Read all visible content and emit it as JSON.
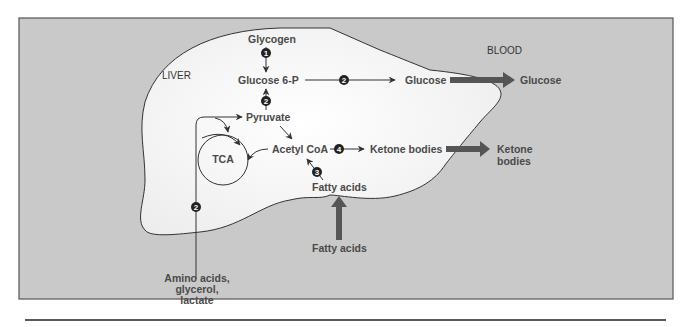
{
  "diagram": {
    "regions": {
      "liver": "LIVER",
      "blood": "BLOOD"
    },
    "nodes": {
      "glycogen": "Glycogen",
      "glucose6p": "Glucose 6-P",
      "glucose_liver": "Glucose",
      "glucose_blood": "Glucose",
      "pyruvate": "Pyruvate",
      "tca": "TCA",
      "acetyl_coa": "Acetyl CoA",
      "ketone_liver": "Ketone bodies",
      "ketone_blood_line1": "Ketone",
      "ketone_blood_line2": "bodies",
      "fatty_acids_liver": "Fatty acids",
      "fatty_acids_blood": "Fatty acids",
      "precursors_line1": "Amino acids,",
      "precursors_line2": "glycerol,",
      "precursors_line3": "lactate"
    },
    "steps": {
      "glycogenolysis": "1",
      "gluconeogenesis_pyruvate": "2",
      "glucose_release": "2",
      "gluconeogenesis_precursors": "2",
      "beta_oxidation": "3",
      "ketogenesis": "4"
    },
    "colors": {
      "frame_bg": "#c9c9c9",
      "liver_fill": "#f7f7f7",
      "text": "#4a4a4a",
      "thick_arrow": "#555555",
      "line": "#333333"
    }
  }
}
